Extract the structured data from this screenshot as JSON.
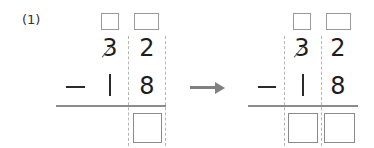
{
  "problem": {
    "label": "(1)",
    "minuend": {
      "tens": "3",
      "ones": "2"
    },
    "subtrahend": {
      "tens": "1",
      "ones": "8"
    },
    "operator": "−",
    "tens_crossed_out": true
  },
  "left_step": {
    "borrow_boxes": [
      "",
      ""
    ],
    "answer_boxes": [
      ""
    ]
  },
  "arrow": {
    "icon": "right-arrow-icon",
    "color": "#808080"
  },
  "right_step": {
    "borrow_boxes": [
      "",
      ""
    ],
    "answer_boxes": [
      "",
      ""
    ]
  }
}
